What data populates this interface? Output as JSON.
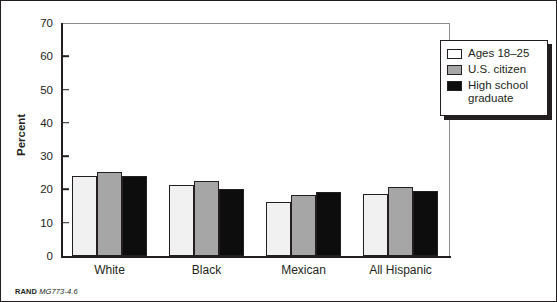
{
  "chart_data": {
    "type": "bar",
    "title": "",
    "subtitle": "",
    "xlabel": "",
    "ylabel": "Percent",
    "ylim": [
      0,
      70
    ],
    "yticks": [
      0,
      10,
      20,
      30,
      40,
      50,
      60,
      70
    ],
    "grid": false,
    "legend_position": "upper-right",
    "categories": [
      "White",
      "Black",
      "Mexican",
      "All Hispanic"
    ],
    "series": [
      {
        "name": "Ages 18–25",
        "color": "#f1f1f1",
        "values": [
          24.0,
          21.3,
          16.1,
          18.5
        ]
      },
      {
        "name": "U.S. citizen",
        "color": "#a6a6a6",
        "values": [
          25.2,
          22.4,
          18.3,
          20.6
        ]
      },
      {
        "name": "High school\ngraduate",
        "color": "#0d0d0d",
        "values": [
          24.0,
          20.2,
          19.3,
          19.6
        ]
      }
    ]
  },
  "axis": {
    "y_label": "Percent",
    "y_tick_labels": [
      "70",
      "60",
      "50",
      "40",
      "30",
      "20",
      "10",
      "0"
    ],
    "x_tick_labels": [
      "White",
      "Black",
      "Mexican",
      "All Hispanic"
    ]
  },
  "legend": {
    "items": [
      {
        "label": "Ages 18–25"
      },
      {
        "label": "U.S. citizen"
      },
      {
        "label": "High school\ngraduate"
      }
    ]
  },
  "caption": {
    "brand": "RAND",
    "code": "MG773-4.6"
  }
}
